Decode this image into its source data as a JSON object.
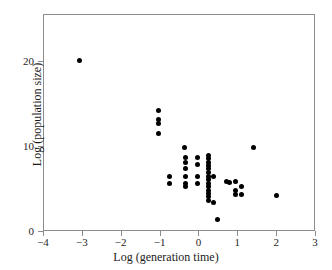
{
  "chart_data": {
    "type": "scatter",
    "title": "",
    "xlabel": "Log (generation time)",
    "ylabel": "Log (population size)",
    "xlim": [
      -4,
      3
    ],
    "ylim": [
      0,
      25.5
    ],
    "xticks": [
      -4,
      -3,
      -2,
      -1,
      0,
      1,
      2,
      3
    ],
    "xticklabels": [
      "−4",
      "−3",
      "−2",
      "−1",
      "0",
      "1",
      "2",
      "3"
    ],
    "yticks": [
      0,
      10,
      20
    ],
    "yticklabels": [
      "0",
      "10",
      "20"
    ],
    "grid": false,
    "legend": null,
    "marker": {
      "shape": "circle",
      "color": "#000000",
      "size_px": 5
    },
    "frame_color": "#8c8c8c",
    "background": "#ffffff",
    "n_points": 58,
    "points": [
      {
        "x": -3.07,
        "y": 20.0
      },
      {
        "x": -1.02,
        "y": 14.2
      },
      {
        "x": -1.02,
        "y": 13.1
      },
      {
        "x": -1.02,
        "y": 12.6
      },
      {
        "x": -1.02,
        "y": 11.5
      },
      {
        "x": -0.35,
        "y": 9.8
      },
      {
        "x": -0.32,
        "y": 8.6
      },
      {
        "x": -0.32,
        "y": 8.1
      },
      {
        "x": -0.32,
        "y": 7.3
      },
      {
        "x": -0.32,
        "y": 6.4
      },
      {
        "x": -0.32,
        "y": 5.6
      },
      {
        "x": -0.32,
        "y": 5.2
      },
      {
        "x": -0.75,
        "y": 6.4
      },
      {
        "x": -0.75,
        "y": 5.6
      },
      {
        "x": -0.02,
        "y": 8.6
      },
      {
        "x": -0.02,
        "y": 7.8
      },
      {
        "x": -0.02,
        "y": 6.4
      },
      {
        "x": -0.02,
        "y": 5.6
      },
      {
        "x": 0.25,
        "y": 8.9
      },
      {
        "x": 0.25,
        "y": 8.5
      },
      {
        "x": 0.25,
        "y": 8.1
      },
      {
        "x": 0.25,
        "y": 7.7
      },
      {
        "x": 0.25,
        "y": 7.3
      },
      {
        "x": 0.25,
        "y": 6.9
      },
      {
        "x": 0.25,
        "y": 6.4
      },
      {
        "x": 0.25,
        "y": 6.0
      },
      {
        "x": 0.25,
        "y": 5.6
      },
      {
        "x": 0.25,
        "y": 5.2
      },
      {
        "x": 0.25,
        "y": 4.8
      },
      {
        "x": 0.25,
        "y": 4.4
      },
      {
        "x": 0.25,
        "y": 4.0
      },
      {
        "x": 0.25,
        "y": 3.6
      },
      {
        "x": 0.4,
        "y": 6.4
      },
      {
        "x": 0.4,
        "y": 3.4
      },
      {
        "x": 0.5,
        "y": 1.4
      },
      {
        "x": 0.72,
        "y": 5.8
      },
      {
        "x": 0.8,
        "y": 5.7
      },
      {
        "x": 0.95,
        "y": 5.8
      },
      {
        "x": 0.95,
        "y": 4.8
      },
      {
        "x": 0.95,
        "y": 4.3
      },
      {
        "x": 1.1,
        "y": 5.2
      },
      {
        "x": 1.12,
        "y": 4.3
      },
      {
        "x": 1.43,
        "y": 9.8
      },
      {
        "x": 2.0,
        "y": 4.2
      }
    ]
  }
}
